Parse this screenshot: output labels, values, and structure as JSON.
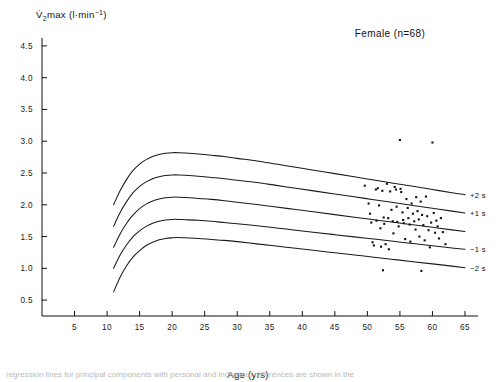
{
  "figure": {
    "annotation": "Female (n=68)",
    "caption_clipped": "regression lines for principal components with personal and individual differences are shown in the"
  },
  "chart_data": {
    "type": "line",
    "title": "",
    "ylabel": "V̇O2max  (l·min−1)",
    "ylabel_parts": {
      "v_dot": "V̇",
      "sub": "2",
      "rest": "max",
      "units_open": "  (l·min",
      "sup": "−1",
      "units_close": ")"
    },
    "xlabel": "Age (yrs)",
    "xlim": [
      0,
      67
    ],
    "ylim": [
      0.25,
      4.75
    ],
    "xticks": [
      5,
      10,
      15,
      20,
      25,
      30,
      35,
      40,
      45,
      50,
      55,
      60,
      65
    ],
    "xticklabels": [
      "5",
      "10",
      "15",
      "20",
      "25",
      "30",
      "35",
      "40",
      "45",
      "50",
      "55",
      "60",
      "65"
    ],
    "yticks": [
      0.5,
      1.0,
      1.5,
      2.0,
      2.5,
      3.0,
      3.5,
      4.0,
      4.5
    ],
    "yticklabels": [
      "0.5",
      "1.0",
      "1.5",
      "2.0",
      "2.5",
      "3.0",
      "3.5",
      "4.0",
      "4.5"
    ],
    "grid": false,
    "legend_position": "right-of-curves",
    "series": [
      {
        "name": "+2 s",
        "label": "+2 s",
        "x": [
          11,
          12,
          13,
          14,
          15,
          16,
          17,
          18,
          19,
          20,
          21,
          22,
          24,
          26,
          28,
          30,
          33,
          36,
          39,
          42,
          45,
          48,
          51,
          54,
          57,
          60,
          63,
          65
        ],
        "values": [
          2.0,
          2.22,
          2.4,
          2.54,
          2.64,
          2.71,
          2.76,
          2.79,
          2.81,
          2.82,
          2.82,
          2.815,
          2.8,
          2.78,
          2.76,
          2.73,
          2.69,
          2.64,
          2.59,
          2.54,
          2.49,
          2.44,
          2.39,
          2.34,
          2.29,
          2.24,
          2.19,
          2.16
        ]
      },
      {
        "name": "+1 s",
        "label": "+1 s",
        "x": [
          11,
          12,
          13,
          14,
          15,
          16,
          17,
          18,
          19,
          20,
          21,
          22,
          24,
          26,
          28,
          30,
          33,
          36,
          39,
          42,
          45,
          48,
          51,
          54,
          57,
          60,
          63,
          65
        ],
        "values": [
          1.66,
          1.88,
          2.05,
          2.19,
          2.29,
          2.36,
          2.41,
          2.44,
          2.46,
          2.47,
          2.47,
          2.465,
          2.45,
          2.43,
          2.41,
          2.385,
          2.35,
          2.305,
          2.26,
          2.215,
          2.17,
          2.125,
          2.08,
          2.035,
          1.99,
          1.945,
          1.9,
          1.87
        ]
      },
      {
        "name": "mean",
        "label": "",
        "x": [
          11,
          12,
          13,
          14,
          15,
          16,
          17,
          18,
          19,
          20,
          21,
          22,
          24,
          26,
          28,
          30,
          33,
          36,
          39,
          42,
          45,
          48,
          51,
          54,
          57,
          60,
          63,
          65
        ],
        "values": [
          1.33,
          1.54,
          1.71,
          1.84,
          1.94,
          2.01,
          2.06,
          2.09,
          2.11,
          2.12,
          2.12,
          2.115,
          2.1,
          2.085,
          2.065,
          2.04,
          2.005,
          1.965,
          1.925,
          1.885,
          1.845,
          1.805,
          1.765,
          1.725,
          1.685,
          1.645,
          1.605,
          1.58
        ]
      },
      {
        "name": "-1 s",
        "label": "−1 s",
        "x": [
          11,
          12,
          13,
          14,
          15,
          16,
          17,
          18,
          19,
          20,
          21,
          22,
          24,
          26,
          28,
          30,
          33,
          36,
          39,
          42,
          45,
          48,
          51,
          54,
          57,
          60,
          63,
          65
        ],
        "values": [
          1.0,
          1.21,
          1.37,
          1.5,
          1.59,
          1.66,
          1.71,
          1.74,
          1.76,
          1.77,
          1.77,
          1.765,
          1.755,
          1.74,
          1.72,
          1.7,
          1.67,
          1.635,
          1.6,
          1.565,
          1.53,
          1.495,
          1.46,
          1.425,
          1.39,
          1.355,
          1.32,
          1.3
        ]
      },
      {
        "name": "-2 s",
        "label": "−2 s",
        "x": [
          11,
          12,
          13,
          14,
          15,
          16,
          17,
          18,
          19,
          20,
          21,
          22,
          24,
          26,
          28,
          30,
          33,
          36,
          39,
          42,
          45,
          48,
          51,
          54,
          57,
          60,
          63,
          65
        ],
        "values": [
          0.63,
          0.86,
          1.04,
          1.18,
          1.28,
          1.36,
          1.41,
          1.45,
          1.47,
          1.48,
          1.485,
          1.48,
          1.47,
          1.455,
          1.44,
          1.42,
          1.385,
          1.35,
          1.315,
          1.28,
          1.245,
          1.21,
          1.175,
          1.14,
          1.105,
          1.07,
          1.035,
          1.01
        ]
      }
    ],
    "scatter": {
      "name": "individual subjects",
      "marker": "square",
      "points": [
        [
          49.6,
          2.3
        ],
        [
          50.2,
          2.02
        ],
        [
          50.4,
          1.86
        ],
        [
          50.6,
          1.72
        ],
        [
          50.8,
          1.41
        ],
        [
          51.0,
          1.36
        ],
        [
          51.3,
          2.24
        ],
        [
          51.4,
          1.75
        ],
        [
          51.6,
          2.26
        ],
        [
          51.8,
          1.99
        ],
        [
          52.0,
          1.63
        ],
        [
          52.1,
          1.34
        ],
        [
          52.3,
          2.22
        ],
        [
          52.5,
          1.8
        ],
        [
          52.6,
          1.7
        ],
        [
          52.8,
          1.38
        ],
        [
          53.0,
          2.33
        ],
        [
          53.2,
          1.79
        ],
        [
          53.3,
          1.3
        ],
        [
          53.5,
          2.21
        ],
        [
          53.7,
          1.92
        ],
        [
          53.9,
          1.74
        ],
        [
          54.0,
          1.55
        ],
        [
          54.2,
          2.28
        ],
        [
          54.4,
          2.24
        ],
        [
          54.5,
          1.97
        ],
        [
          54.6,
          1.73
        ],
        [
          54.8,
          1.66
        ],
        [
          55.0,
          3.02
        ],
        [
          55.1,
          2.25
        ],
        [
          55.2,
          2.2
        ],
        [
          55.4,
          1.88
        ],
        [
          55.5,
          1.76
        ],
        [
          55.6,
          1.71
        ],
        [
          55.8,
          1.46
        ],
        [
          56.0,
          2.09
        ],
        [
          56.2,
          1.95
        ],
        [
          56.3,
          1.79
        ],
        [
          56.5,
          1.69
        ],
        [
          56.6,
          1.42
        ],
        [
          56.8,
          2.02
        ],
        [
          57.0,
          1.86
        ],
        [
          57.2,
          1.74
        ],
        [
          57.4,
          1.61
        ],
        [
          57.5,
          2.12
        ],
        [
          57.7,
          1.9
        ],
        [
          57.9,
          1.77
        ],
        [
          58.0,
          1.5
        ],
        [
          58.2,
          2.05
        ],
        [
          58.4,
          1.84
        ],
        [
          58.6,
          1.68
        ],
        [
          58.8,
          1.44
        ],
        [
          59.0,
          2.13
        ],
        [
          59.2,
          1.82
        ],
        [
          59.4,
          1.6
        ],
        [
          59.6,
          1.33
        ],
        [
          59.8,
          1.72
        ],
        [
          60.0,
          2.98
        ],
        [
          60.2,
          1.87
        ],
        [
          60.4,
          1.56
        ],
        [
          60.6,
          1.75
        ],
        [
          60.8,
          1.66
        ],
        [
          61.0,
          1.47
        ],
        [
          61.3,
          1.79
        ],
        [
          61.6,
          1.57
        ],
        [
          62.0,
          1.38
        ],
        [
          52.4,
          0.97
        ],
        [
          58.3,
          0.96
        ]
      ]
    }
  }
}
